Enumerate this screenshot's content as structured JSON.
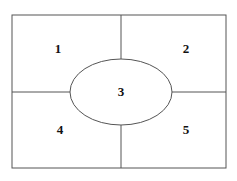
{
  "diagram": {
    "type": "region-partition-diagram",
    "title": "",
    "canvas": {
      "width": 237,
      "height": 181,
      "background": "#ffffff"
    },
    "stroke_color": "#555555",
    "label_color": "#111111",
    "outer_rectangle": {
      "x": 12,
      "y": 15,
      "width": 214,
      "height": 153
    },
    "ellipse": {
      "cx": 121,
      "cy": 92,
      "rx": 51,
      "ry": 33
    },
    "dividers": [
      {
        "name": "vertical-top",
        "x1": 121,
        "y1": 15,
        "x2": 121,
        "y2": 59
      },
      {
        "name": "vertical-bottom",
        "x1": 121,
        "y1": 125,
        "x2": 121,
        "y2": 168
      },
      {
        "name": "horizontal-left",
        "x1": 12,
        "y1": 92,
        "x2": 70,
        "y2": 92
      },
      {
        "name": "horizontal-right",
        "x1": 172,
        "y1": 92,
        "x2": 226,
        "y2": 92
      }
    ],
    "regions": [
      {
        "id": "region-1",
        "label": "1",
        "x": 58,
        "y": 50
      },
      {
        "id": "region-2",
        "label": "2",
        "x": 186,
        "y": 50
      },
      {
        "id": "region-3",
        "label": "3",
        "x": 121,
        "y": 93
      },
      {
        "id": "region-4",
        "label": "4",
        "x": 60,
        "y": 131
      },
      {
        "id": "region-5",
        "label": "5",
        "x": 186,
        "y": 131
      }
    ]
  }
}
